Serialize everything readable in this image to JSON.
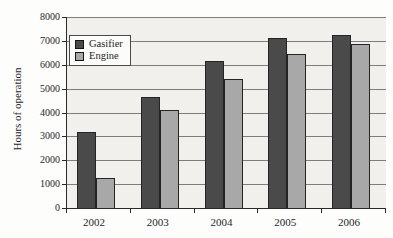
{
  "chart_data": {
    "type": "bar",
    "categories": [
      "2002",
      "2003",
      "2004",
      "2005",
      "2006"
    ],
    "series": [
      {
        "name": "Gasifier",
        "color": "#4a4a4a",
        "values": [
          3200,
          4650,
          6150,
          7100,
          7250
        ]
      },
      {
        "name": "Engine",
        "color": "#a8a8a8",
        "values": [
          1250,
          4100,
          5400,
          6450,
          6850
        ]
      }
    ],
    "title": "",
    "xlabel": "",
    "ylabel": "Hours of operation",
    "ylim": [
      0,
      8000
    ],
    "yticks": [
      0,
      1000,
      2000,
      3000,
      4000,
      5000,
      6000,
      7000,
      8000
    ],
    "grid": true,
    "legend_position": "top-left"
  },
  "colors": {
    "plot_background": "#f1f0ec",
    "gridline": "#7e7e7e",
    "axis": "#2b2b2b",
    "gasifier_bar": "#4a4a4a",
    "engine_bar": "#a8a8a8",
    "legend_background": "#fcfcfa"
  }
}
